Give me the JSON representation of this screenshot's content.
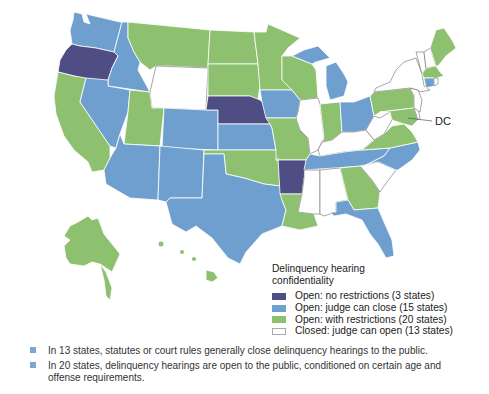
{
  "colors": {
    "open_no_restrictions": "#4f4e84",
    "open_judge_can_close": "#6f9fcf",
    "open_with_restrictions": "#8dc06f",
    "closed_judge_can_open": "#ffffff",
    "bullet": "#7fa6cf"
  },
  "map": {
    "dc_label": "DC",
    "states": {
      "open_no_restrictions": [
        "OR",
        "NE",
        "AR"
      ],
      "open_judge_can_close": [
        "WA",
        "ID",
        "NV",
        "AZ",
        "NM",
        "CO",
        "KS",
        "IA",
        "TX",
        "MI",
        "OH",
        "TN",
        "NC",
        "FL",
        "CT"
      ],
      "open_with_restrictions": [
        "CA",
        "MT",
        "ND",
        "SD",
        "UT",
        "MN",
        "WI",
        "MO",
        "OK",
        "LA",
        "IN",
        "PA",
        "VA",
        "MD",
        "GA",
        "ME",
        "MA",
        "AK",
        "HI",
        "DC"
      ],
      "closed_judge_can_open": [
        "WY",
        "IL",
        "KY",
        "WV",
        "MS",
        "AL",
        "SC",
        "NY",
        "VT",
        "NH",
        "NJ",
        "DE",
        "RI"
      ]
    }
  },
  "legend": {
    "title_line1": "Delinquency hearing",
    "title_line2": "confidentiality",
    "items": [
      {
        "label": "Open: no restrictions (3 states)"
      },
      {
        "label": "Open: judge can close (15 states)"
      },
      {
        "label": "Open: with restrictions (20 states)"
      },
      {
        "label": "Closed: judge can open (13 states)"
      }
    ]
  },
  "notes": [
    {
      "text": "In 13 states, statutes or court rules generally close delinquency hearings to the public."
    },
    {
      "text": "In 20 states, delinquency hearings are open to the public, conditioned on certain age and offense requirements."
    }
  ]
}
